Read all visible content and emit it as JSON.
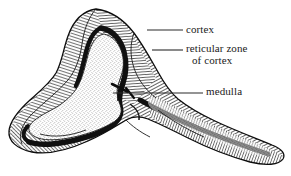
{
  "figure": {
    "kind": "anatomical-cross-section-engraving",
    "background_color": "#ffffff",
    "ink_color": "#111111",
    "style": "black-and-white line engraving with hatching and stipple"
  },
  "labels": [
    {
      "id": "cortex",
      "text": "cortex",
      "leader": {
        "x1": 147,
        "y1": 30,
        "x2": 183,
        "y2": 30
      }
    },
    {
      "id": "reticular_zone",
      "line1": "reticular zone",
      "line2": "of cortex",
      "leader": {
        "x1": 152,
        "y1": 50,
        "x2": 183,
        "y2": 50
      }
    },
    {
      "id": "medulla",
      "text": "medulla",
      "leader": {
        "x1": 113,
        "y1": 93,
        "x2": 203,
        "y2": 93
      }
    }
  ],
  "regions": {
    "cortex": {
      "name": "cortex",
      "fill": "dense-hatching",
      "tone": "#4a4a4a"
    },
    "reticular_zone": {
      "name": "reticular zone of cortex",
      "fill": "solid-dark-band",
      "tone": "#111111"
    },
    "medulla": {
      "name": "medulla",
      "fill": "stipple",
      "tone": "#dedede"
    }
  },
  "colors": {
    "ink": "#111111",
    "hatch": "#3c3c3c",
    "stipple": "#555555",
    "paper": "#ffffff",
    "leader_line": "#2a2a2a",
    "text": "#1a1a1a"
  }
}
